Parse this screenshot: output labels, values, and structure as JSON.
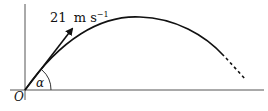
{
  "diagram": {
    "type": "projectile-trajectory",
    "origin_label": "O",
    "angle_label": "α",
    "velocity": {
      "magnitude": "21",
      "unit": "m s",
      "unit_exponent": "−1"
    },
    "colors": {
      "stroke": "#111111",
      "axis": "#555555",
      "background": "#ffffff"
    }
  }
}
